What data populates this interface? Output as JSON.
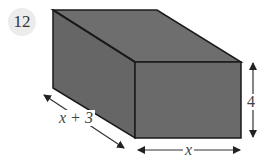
{
  "problem": {
    "number": "12"
  },
  "diagram": {
    "type": "rectangular-prism",
    "fill_color": "#6e6e6e",
    "edge_color": "#1a1a1a",
    "arrow_color": "#333333",
    "labels": {
      "depth": "x + 3",
      "width": "x",
      "height": "4"
    }
  }
}
